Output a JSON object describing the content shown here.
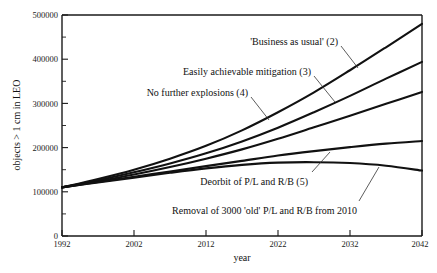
{
  "chart_data": {
    "type": "line",
    "title": "",
    "xlabel": "year",
    "ylabel": "objects > 1 cm in LEO",
    "xlim": [
      1992,
      2042
    ],
    "ylim": [
      0,
      500000
    ],
    "grid": false,
    "legend_position": "inline-annotations",
    "xticks": [
      1992,
      2002,
      2012,
      2022,
      2032,
      2042
    ],
    "xtick_labels": [
      "1992",
      "2002",
      "2012",
      "2022",
      "2032",
      "2042"
    ],
    "yticks": [
      0,
      100000,
      200000,
      300000,
      400000,
      500000
    ],
    "ytick_labels": [
      "0",
      "100000",
      "200000",
      "300000",
      "400000",
      "500000"
    ],
    "yticks_minor": [
      50000,
      150000,
      250000,
      350000,
      450000
    ],
    "x": [
      1992,
      1997,
      2002,
      2007,
      2012,
      2017,
      2022,
      2027,
      2032,
      2037,
      2042
    ],
    "series": [
      {
        "name": "'Business as usual' (2)",
        "label": "'Business as usual' (2)",
        "values": [
          110000,
          129000,
          150000,
          175000,
          204000,
          239000,
          280000,
          325000,
          375000,
          427000,
          480000
        ]
      },
      {
        "name": "Easily achievable mitigation (3)",
        "label": "Easily achievable mitigation (3)",
        "values": [
          110000,
          126000,
          144000,
          164000,
          187000,
          214000,
          245000,
          280000,
          317000,
          356000,
          394000
        ]
      },
      {
        "name": "No further explosions (4)",
        "label": "No further explosions (4)",
        "values": [
          110000,
          124000,
          139000,
          156000,
          175000,
          196000,
          220000,
          246000,
          272000,
          299000,
          326000
        ]
      },
      {
        "name": "Deorbit of P/L and R/B (5)",
        "label": "Deorbit of P/L and R/B (5)",
        "values": [
          110000,
          122000,
          134000,
          146000,
          158000,
          170000,
          182000,
          192000,
          201000,
          209000,
          215000
        ]
      },
      {
        "name": "Removal of 3000 'old' P/L and R/B from 2010",
        "label": "Removal of 3000 'old' P/L and R/B from 2010",
        "values": [
          110000,
          121000,
          132000,
          143000,
          153000,
          161000,
          166000,
          167000,
          165000,
          159000,
          148000
        ]
      }
    ],
    "annotations": [
      {
        "text": "'Business as usual' (2)",
        "series": "'Business as usual' (2)"
      },
      {
        "text": "Easily achievable mitigation (3)",
        "series": "Easily achievable mitigation (3)"
      },
      {
        "text": "No further explosions (4)",
        "series": "No further explosions (4)"
      },
      {
        "text": "Deorbit of P/L and R/B (5)",
        "series": "Deorbit of P/L and R/B (5)"
      },
      {
        "text": "Removal of 3000 'old' P/L and R/B from 2010",
        "series": "Removal of 3000 'old' P/L and R/B from 2010"
      }
    ],
    "colors": {
      "curve": "#111111",
      "axis": "#1a1a1a",
      "background": "#ffffff",
      "leader": "#333333"
    }
  }
}
